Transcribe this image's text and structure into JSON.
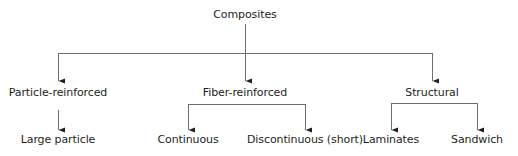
{
  "diagram": {
    "type": "tree",
    "root": {
      "label": "Composites"
    },
    "branches": [
      {
        "label": "Particle-reinforced",
        "children": [
          {
            "label": "Large particle"
          }
        ]
      },
      {
        "label": "Fiber-reinforced",
        "children": [
          {
            "label": "Continuous"
          },
          {
            "label": "Discontinuous (short)"
          }
        ]
      },
      {
        "label": "Structural",
        "children": [
          {
            "label": "Laminates"
          },
          {
            "label": "Sandwich"
          }
        ]
      }
    ],
    "line_color": "#6d6e71",
    "text_color": "#231f20"
  }
}
